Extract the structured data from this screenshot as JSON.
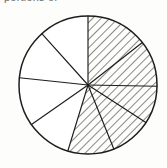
{
  "figure": {
    "kind": "pie-fraction-diagram",
    "caption_fragment": "portions of",
    "background_color": "#fdfdfb",
    "line_color": "#1d1d1d",
    "hatch_color": "#1d1d1d",
    "plain_fill_color": "#ffffff"
  },
  "geometry": {
    "center_x": 88,
    "center_y": 85,
    "radius": 69,
    "stroke_width": 1.15,
    "outline_stroke_width": 1.5,
    "hatch_angle_deg": 45,
    "hatch_spacing_px": 6
  },
  "chart_data": {
    "type": "pie",
    "title": "",
    "subtitle": "",
    "xlabel": "",
    "ylabel": "",
    "legend": [],
    "annotations": [],
    "grid": false,
    "total_sectors": 9,
    "shaded_sectors": 5,
    "unshaded_sectors": 4,
    "fraction_shaded": "5/9",
    "categories": [
      "sector-1",
      "sector-2",
      "sector-3",
      "sector-4",
      "sector-5",
      "sector-6",
      "sector-7",
      "sector-8",
      "sector-9"
    ],
    "values": [
      52,
      39,
      32,
      35,
      39,
      38,
      41,
      42,
      42
    ],
    "series": [
      {
        "name": "shaded",
        "values": [
          1,
          1,
          1,
          1,
          1,
          0,
          0,
          0,
          0
        ]
      }
    ],
    "sectors": [
      {
        "id": "sector-1",
        "start_deg": 0,
        "end_deg": 52,
        "sweep_deg": 52,
        "shaded": true,
        "label": ""
      },
      {
        "id": "sector-2",
        "start_deg": 52,
        "end_deg": 91,
        "sweep_deg": 39,
        "shaded": true,
        "label": ""
      },
      {
        "id": "sector-3",
        "start_deg": 91,
        "end_deg": 123,
        "sweep_deg": 32,
        "shaded": true,
        "label": ""
      },
      {
        "id": "sector-4",
        "start_deg": 123,
        "end_deg": 158,
        "sweep_deg": 35,
        "shaded": true,
        "label": ""
      },
      {
        "id": "sector-5",
        "start_deg": 158,
        "end_deg": 197,
        "sweep_deg": 39,
        "shaded": true,
        "label": ""
      },
      {
        "id": "sector-6",
        "start_deg": 197,
        "end_deg": 235,
        "sweep_deg": 38,
        "shaded": false,
        "label": ""
      },
      {
        "id": "sector-7",
        "start_deg": 235,
        "end_deg": 276,
        "sweep_deg": 41,
        "shaded": false,
        "label": ""
      },
      {
        "id": "sector-8",
        "start_deg": 276,
        "end_deg": 318,
        "sweep_deg": 42,
        "shaded": false,
        "label": ""
      },
      {
        "id": "sector-9",
        "start_deg": 318,
        "end_deg": 360,
        "sweep_deg": 42,
        "shaded": false,
        "label": ""
      }
    ]
  }
}
